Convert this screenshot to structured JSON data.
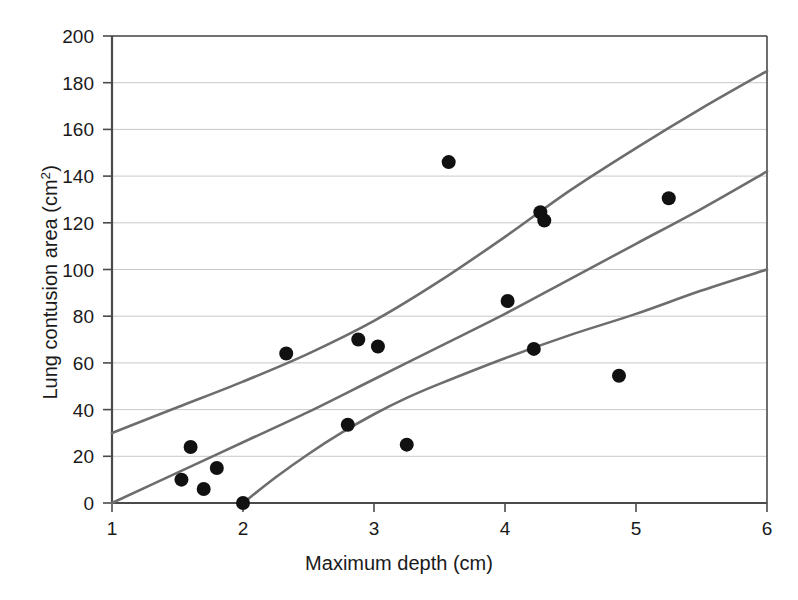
{
  "chart_data": {
    "type": "scatter",
    "title": "",
    "xlabel": "Maximum depth (cm)",
    "ylabel": "Lung contusion area (cm2)",
    "ylabel_base": "Lung contusion area (cm",
    "ylabel_sup": "2",
    "ylabel_tail": ")",
    "xlim": [
      1,
      6
    ],
    "ylim": [
      0,
      200
    ],
    "xticks": [
      1,
      2,
      3,
      4,
      5,
      6
    ],
    "yticks": [
      0,
      20,
      40,
      60,
      80,
      100,
      120,
      140,
      160,
      180,
      200
    ],
    "xtick_labels": [
      "1",
      "2",
      "3",
      "4",
      "5",
      "6"
    ],
    "ytick_labels": [
      "0",
      "20",
      "40",
      "60",
      "80",
      "100",
      "120",
      "140",
      "160",
      "180",
      "200"
    ],
    "grid": "horizontal",
    "legend": "none",
    "colors": {
      "point": "#111111",
      "curve": "#6d6d6d",
      "grid": "#c9c9c9",
      "axis": "#4a4a4a",
      "background": "#ffffff"
    },
    "marker": {
      "shape": "circle",
      "radius_px": 7,
      "fill": "#111111"
    },
    "points": [
      {
        "x": 1.53,
        "y": 10.0
      },
      {
        "x": 1.6,
        "y": 24.0
      },
      {
        "x": 1.7,
        "y": 6.0
      },
      {
        "x": 1.8,
        "y": 15.0
      },
      {
        "x": 2.0,
        "y": 0.0
      },
      {
        "x": 2.33,
        "y": 64.0
      },
      {
        "x": 2.8,
        "y": 33.5
      },
      {
        "x": 2.88,
        "y": 70.0
      },
      {
        "x": 3.03,
        "y": 67.0
      },
      {
        "x": 3.25,
        "y": 25.0
      },
      {
        "x": 3.57,
        "y": 146.0
      },
      {
        "x": 4.02,
        "y": 86.5
      },
      {
        "x": 4.22,
        "y": 66.0
      },
      {
        "x": 4.27,
        "y": 124.5
      },
      {
        "x": 4.3,
        "y": 121.0
      },
      {
        "x": 4.87,
        "y": 54.5
      },
      {
        "x": 5.25,
        "y": 130.5
      }
    ],
    "curves": [
      {
        "name": "upper-confidence-band",
        "style": "solid",
        "points": [
          {
            "x": 1.0,
            "y": 30.0
          },
          {
            "x": 1.5,
            "y": 41.0
          },
          {
            "x": 2.0,
            "y": 52.0
          },
          {
            "x": 2.5,
            "y": 64.0
          },
          {
            "x": 3.0,
            "y": 78.0
          },
          {
            "x": 3.5,
            "y": 95.0
          },
          {
            "x": 4.0,
            "y": 114.0
          },
          {
            "x": 4.5,
            "y": 134.0
          },
          {
            "x": 5.0,
            "y": 152.0
          },
          {
            "x": 5.5,
            "y": 169.0
          },
          {
            "x": 6.0,
            "y": 185.0
          }
        ]
      },
      {
        "name": "fitted-regression-line",
        "style": "solid",
        "points": [
          {
            "x": 1.0,
            "y": 0.0
          },
          {
            "x": 1.5,
            "y": 13.0
          },
          {
            "x": 2.0,
            "y": 26.0
          },
          {
            "x": 2.5,
            "y": 39.0
          },
          {
            "x": 3.0,
            "y": 53.0
          },
          {
            "x": 3.5,
            "y": 67.0
          },
          {
            "x": 4.0,
            "y": 81.0
          },
          {
            "x": 4.5,
            "y": 96.0
          },
          {
            "x": 5.0,
            "y": 111.0
          },
          {
            "x": 5.5,
            "y": 126.0
          },
          {
            "x": 6.0,
            "y": 142.0
          }
        ]
      },
      {
        "name": "lower-confidence-band",
        "style": "solid",
        "points": [
          {
            "x": 2.0,
            "y": 0.0
          },
          {
            "x": 2.25,
            "y": 11.0
          },
          {
            "x": 2.5,
            "y": 21.0
          },
          {
            "x": 2.75,
            "y": 30.0
          },
          {
            "x": 3.0,
            "y": 38.0
          },
          {
            "x": 3.25,
            "y": 45.0
          },
          {
            "x": 3.5,
            "y": 51.0
          },
          {
            "x": 4.0,
            "y": 62.0
          },
          {
            "x": 4.5,
            "y": 72.0
          },
          {
            "x": 5.0,
            "y": 81.0
          },
          {
            "x": 5.5,
            "y": 91.0
          },
          {
            "x": 6.0,
            "y": 100.0
          }
        ]
      }
    ]
  }
}
